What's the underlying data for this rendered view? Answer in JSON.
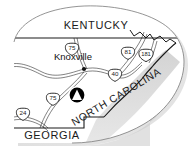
{
  "map": {
    "title": "Regional locator map of East Tennessee",
    "background_color": "#e9e9e9",
    "land_color": "#ffffff",
    "outline_color": "#1a1a1a",
    "shadow_color": "#bdbdbd",
    "ridge_color": "#d2d2d2",
    "states": [
      {
        "id": "kentucky",
        "name": "KENTUCKY",
        "x": 96,
        "y": 29,
        "rotation": 0,
        "font_size": 11
      },
      {
        "id": "north-carolina",
        "name": "NORTH CAROLINA",
        "x": 118,
        "y": 100,
        "rotation": -31,
        "font_size": 10.5
      },
      {
        "id": "georgia",
        "name": "GEORGIA",
        "x": 52,
        "y": 139,
        "rotation": 0,
        "font_size": 11
      }
    ],
    "cities": [
      {
        "id": "knoxville",
        "name": "Knoxville",
        "label_x": 73,
        "label_y": 60,
        "dot_x": 84,
        "dot_y": 69,
        "font_size": 9.5
      }
    ],
    "shields": [
      {
        "id": "i-75-north",
        "route": "75",
        "x": 72,
        "y": 50,
        "type": "interstate"
      },
      {
        "id": "i-81",
        "route": "81",
        "x": 128,
        "y": 54,
        "type": "interstate"
      },
      {
        "id": "i-181",
        "route": "181",
        "x": 146,
        "y": 56,
        "type": "interstate"
      },
      {
        "id": "i-40",
        "route": "40",
        "x": 115,
        "y": 76,
        "type": "interstate"
      },
      {
        "id": "i-75-south",
        "route": "75",
        "x": 53,
        "y": 100,
        "type": "interstate"
      },
      {
        "id": "i-24",
        "route": "24",
        "x": 23,
        "y": 115,
        "type": "interstate"
      }
    ],
    "markers": [
      {
        "id": "park-marker",
        "icon": "triangle-in-circle-icon",
        "label": "",
        "x": 77,
        "y": 95,
        "radius": 8
      }
    ],
    "legend": {
      "marker_meaning": "",
      "scale_text": ""
    }
  }
}
